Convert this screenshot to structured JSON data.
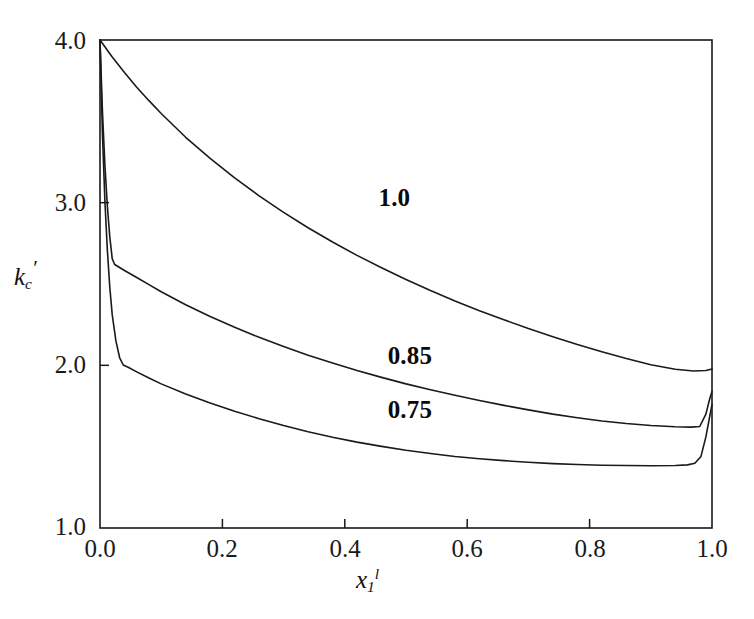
{
  "chart_data": {
    "type": "line",
    "title": "",
    "subtitle": "",
    "xlabel": "x_1^l",
    "ylabel": "k_c'",
    "xlabel_parts": {
      "base": "x",
      "sub": "1",
      "sup": "l"
    },
    "ylabel_parts": {
      "base": "k",
      "sub": "c",
      "prime": "′"
    },
    "xlim": [
      0.0,
      1.0
    ],
    "ylim": [
      1.0,
      4.0
    ],
    "xticks": [
      "0.0",
      "0.2",
      "0.4",
      "0.6",
      "0.8",
      "1.0"
    ],
    "xtick_values": [
      0.0,
      0.2,
      0.4,
      0.6,
      0.8,
      1.0
    ],
    "yticks": [
      "1.0",
      "2.0",
      "3.0",
      "4.0"
    ],
    "ytick_values": [
      1.0,
      2.0,
      3.0,
      4.0
    ],
    "grid": false,
    "legend_position": "inline-annotations",
    "line_color": "#1a1a1a",
    "line_width": 1.6,
    "axis_color": "#1a1a1a",
    "background": "#ffffff",
    "annotations": [
      {
        "text": "1.0",
        "x": 0.455,
        "y": 3.02,
        "series": "1.0"
      },
      {
        "text": "0.85",
        "x": 0.47,
        "y": 2.05,
        "series": "0.85"
      },
      {
        "text": "0.75",
        "x": 0.47,
        "y": 1.72,
        "series": "0.75"
      }
    ],
    "series": [
      {
        "name": "1.0",
        "label": "1.0",
        "points": [
          [
            0.0,
            4.0
          ],
          [
            0.02,
            3.895
          ],
          [
            0.04,
            3.8
          ],
          [
            0.06,
            3.71
          ],
          [
            0.08,
            3.627
          ],
          [
            0.1,
            3.548
          ],
          [
            0.14,
            3.402
          ],
          [
            0.18,
            3.272
          ],
          [
            0.22,
            3.152
          ],
          [
            0.26,
            3.042
          ],
          [
            0.3,
            2.94
          ],
          [
            0.34,
            2.846
          ],
          [
            0.38,
            2.758
          ],
          [
            0.42,
            2.676
          ],
          [
            0.46,
            2.6
          ],
          [
            0.5,
            2.528
          ],
          [
            0.54,
            2.46
          ],
          [
            0.58,
            2.396
          ],
          [
            0.62,
            2.336
          ],
          [
            0.66,
            2.28
          ],
          [
            0.7,
            2.226
          ],
          [
            0.74,
            2.176
          ],
          [
            0.78,
            2.128
          ],
          [
            0.82,
            2.084
          ],
          [
            0.86,
            2.042
          ],
          [
            0.9,
            2.004
          ],
          [
            0.94,
            1.976
          ],
          [
            0.97,
            1.965
          ],
          [
            0.99,
            1.968
          ],
          [
            1.0,
            1.978
          ]
        ]
      },
      {
        "name": "0.85",
        "label": "0.85",
        "points": [
          [
            0.0,
            4.0
          ],
          [
            0.004,
            3.56
          ],
          [
            0.008,
            3.23
          ],
          [
            0.012,
            2.98
          ],
          [
            0.016,
            2.79
          ],
          [
            0.02,
            2.655
          ],
          [
            0.024,
            2.62
          ],
          [
            0.03,
            2.606
          ],
          [
            0.04,
            2.583
          ],
          [
            0.06,
            2.54
          ],
          [
            0.08,
            2.496
          ],
          [
            0.1,
            2.452
          ],
          [
            0.14,
            2.372
          ],
          [
            0.18,
            2.3
          ],
          [
            0.22,
            2.234
          ],
          [
            0.26,
            2.172
          ],
          [
            0.3,
            2.116
          ],
          [
            0.34,
            2.062
          ],
          [
            0.38,
            2.014
          ],
          [
            0.42,
            1.968
          ],
          [
            0.46,
            1.926
          ],
          [
            0.5,
            1.886
          ],
          [
            0.54,
            1.85
          ],
          [
            0.58,
            1.816
          ],
          [
            0.62,
            1.784
          ],
          [
            0.66,
            1.754
          ],
          [
            0.7,
            1.726
          ],
          [
            0.74,
            1.7
          ],
          [
            0.78,
            1.678
          ],
          [
            0.82,
            1.658
          ],
          [
            0.86,
            1.642
          ],
          [
            0.9,
            1.63
          ],
          [
            0.94,
            1.622
          ],
          [
            0.965,
            1.62
          ],
          [
            0.98,
            1.624
          ],
          [
            0.99,
            1.7
          ],
          [
            0.996,
            1.79
          ],
          [
            1.0,
            1.84
          ]
        ]
      },
      {
        "name": "0.75",
        "label": "0.75",
        "points": [
          [
            0.0,
            4.0
          ],
          [
            0.004,
            3.42
          ],
          [
            0.008,
            3.01
          ],
          [
            0.012,
            2.71
          ],
          [
            0.016,
            2.48
          ],
          [
            0.02,
            2.31
          ],
          [
            0.026,
            2.15
          ],
          [
            0.032,
            2.048
          ],
          [
            0.038,
            2.002
          ],
          [
            0.046,
            1.988
          ],
          [
            0.06,
            1.96
          ],
          [
            0.08,
            1.922
          ],
          [
            0.1,
            1.886
          ],
          [
            0.14,
            1.824
          ],
          [
            0.18,
            1.768
          ],
          [
            0.22,
            1.718
          ],
          [
            0.26,
            1.672
          ],
          [
            0.3,
            1.63
          ],
          [
            0.34,
            1.592
          ],
          [
            0.38,
            1.558
          ],
          [
            0.42,
            1.528
          ],
          [
            0.46,
            1.502
          ],
          [
            0.5,
            1.478
          ],
          [
            0.54,
            1.458
          ],
          [
            0.58,
            1.44
          ],
          [
            0.62,
            1.426
          ],
          [
            0.66,
            1.414
          ],
          [
            0.7,
            1.404
          ],
          [
            0.74,
            1.396
          ],
          [
            0.78,
            1.39
          ],
          [
            0.82,
            1.386
          ],
          [
            0.86,
            1.384
          ],
          [
            0.9,
            1.383
          ],
          [
            0.94,
            1.384
          ],
          [
            0.96,
            1.388
          ],
          [
            0.972,
            1.398
          ],
          [
            0.982,
            1.44
          ],
          [
            0.99,
            1.56
          ],
          [
            0.996,
            1.68
          ],
          [
            1.0,
            1.76
          ]
        ]
      }
    ]
  },
  "axes": {
    "y_tick_labels": [
      "4.0",
      "3.0",
      "2.0",
      "1.0"
    ],
    "x_tick_labels": [
      "0.0",
      "0.2",
      "0.4",
      "0.6",
      "0.8",
      "1.0"
    ]
  }
}
